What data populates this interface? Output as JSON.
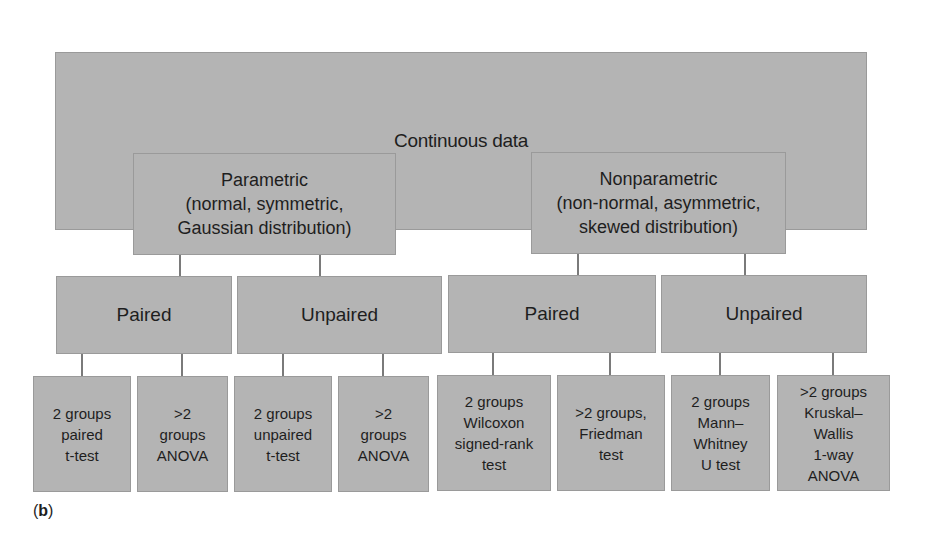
{
  "diagram": {
    "root": {
      "label": "Continuous data"
    },
    "branches": [
      {
        "label": "Parametric\n(normal, symmetric,\nGaussian distribution)",
        "children": [
          {
            "label": "Paired",
            "tests": [
              {
                "label": "2 groups\npaired\nt-test"
              },
              {
                "label": ">2\ngroups\nANOVA"
              }
            ]
          },
          {
            "label": "Unpaired",
            "tests": [
              {
                "label": "2 groups\nunpaired\nt-test"
              },
              {
                "label": ">2\ngroups\nANOVA"
              }
            ]
          }
        ]
      },
      {
        "label": "Nonparametric\n(non-normal, asymmetric,\nskewed distribution)",
        "children": [
          {
            "label": "Paired",
            "tests": [
              {
                "label": "2 groups\nWilcoxon\nsigned-rank\ntest"
              },
              {
                "label": ">2 groups,\nFriedman\ntest"
              }
            ]
          },
          {
            "label": "Unpaired",
            "tests": [
              {
                "label": "2 groups\nMann–\nWhitney\nU test"
              },
              {
                "label": ">2 groups\nKruskal–\nWallis\n1-way\nANOVA"
              }
            ]
          }
        ]
      }
    ]
  },
  "panel_label": "(b)",
  "panel_letter": "b",
  "colors": {
    "box_fill": "#b4b4b4",
    "box_border": "#9a9a9a",
    "connector": "#7a7a7a",
    "text": "#1e1e1e"
  }
}
